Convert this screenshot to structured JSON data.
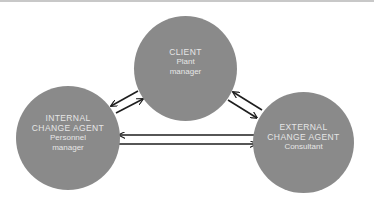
{
  "diagram": {
    "type": "relationship-triangle",
    "colors": {
      "node_fill": "#8a8a8a",
      "node_text": "#e6e6e6",
      "arrow": "#1e1e1e",
      "background": "#ffffff"
    },
    "nodes": {
      "client": {
        "title": "CLIENT",
        "role": "Plant\nmanager"
      },
      "internal": {
        "title": "INTERNAL\nCHANGE AGENT",
        "role": "Personnel\nmanager"
      },
      "external": {
        "title": "EXTERNAL\nCHANGE AGENT",
        "role": "Consultant"
      }
    },
    "edges": [
      {
        "from": "client",
        "to": "internal"
      },
      {
        "from": "internal",
        "to": "client"
      },
      {
        "from": "external",
        "to": "client"
      },
      {
        "from": "client",
        "to": "external"
      },
      {
        "from": "external",
        "to": "internal"
      },
      {
        "from": "internal",
        "to": "external"
      }
    ]
  }
}
